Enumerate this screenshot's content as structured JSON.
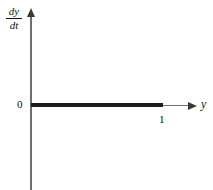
{
  "figure": {
    "background_color": "#ffffff",
    "axis_color": "#6e6e6e",
    "curve_color": "#1b1b1b",
    "text_color": "#121212"
  },
  "axes": {
    "vertical": {
      "label_numerator": "dy",
      "label_denominator": "dt",
      "label_plain": "dy/dt",
      "arrow": "arrow-up"
    },
    "horizontal": {
      "label": "y",
      "arrow": "arrow-right"
    }
  },
  "tick_labels": {
    "origin": "0",
    "one": "1"
  },
  "chart_data": {
    "type": "line",
    "title": "",
    "subtitle": "",
    "xlabel": "y",
    "ylabel": "dy/dt",
    "xlim": [
      0,
      1.2
    ],
    "ylim": [
      -1,
      1
    ],
    "grid": false,
    "legend": null,
    "xticks": [
      0,
      1
    ],
    "xticklabels": [
      "0",
      "1"
    ],
    "yticks": [
      0
    ],
    "yticklabels": [
      "0"
    ],
    "series": [
      {
        "name": "dy/dt = 0",
        "style": "solid-bold",
        "color": "#1b1b1b",
        "x": [
          0,
          1
        ],
        "y": [
          0,
          0
        ]
      }
    ],
    "annotations": []
  }
}
